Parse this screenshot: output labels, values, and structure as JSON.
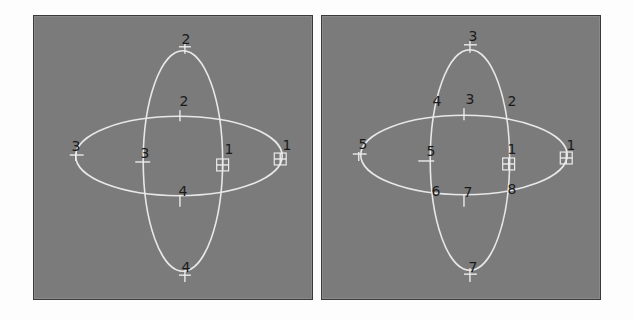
{
  "panels": [
    {
      "id": "left",
      "labels": [
        {
          "text": "2",
          "x": 152,
          "y": 30
        },
        {
          "text": "2",
          "x": 150,
          "y": 92
        },
        {
          "text": "3",
          "x": 42,
          "y": 137
        },
        {
          "text": "3",
          "x": 111,
          "y": 144
        },
        {
          "text": "1",
          "x": 195,
          "y": 140
        },
        {
          "text": "1",
          "x": 253,
          "y": 136
        },
        {
          "text": "4",
          "x": 149,
          "y": 182
        },
        {
          "text": "4",
          "x": 152,
          "y": 258
        }
      ]
    },
    {
      "id": "right",
      "labels": [
        {
          "text": "3",
          "x": 151,
          "y": 27
        },
        {
          "text": "4",
          "x": 115,
          "y": 92
        },
        {
          "text": "3",
          "x": 148,
          "y": 90
        },
        {
          "text": "2",
          "x": 190,
          "y": 92
        },
        {
          "text": "5",
          "x": 41,
          "y": 135
        },
        {
          "text": "5",
          "x": 109,
          "y": 142
        },
        {
          "text": "1",
          "x": 190,
          "y": 140
        },
        {
          "text": "1",
          "x": 249,
          "y": 136
        },
        {
          "text": "6",
          "x": 114,
          "y": 182
        },
        {
          "text": "7",
          "x": 146,
          "y": 183
        },
        {
          "text": "8",
          "x": 190,
          "y": 180
        },
        {
          "text": "7",
          "x": 151,
          "y": 258
        }
      ]
    }
  ],
  "colors": {
    "panel_bg": "#7b7b7b",
    "curve": "#e8e8e8",
    "label": "#1a1a1a",
    "page_bg": "#fdfdfd"
  }
}
